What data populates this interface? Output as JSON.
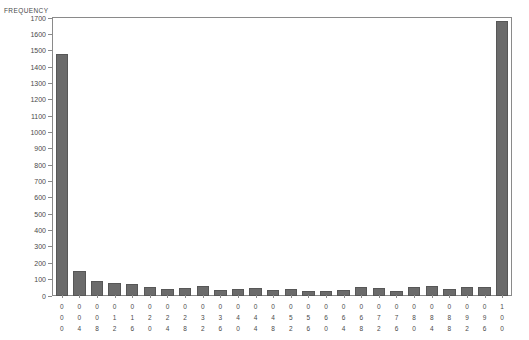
{
  "chart_data": {
    "type": "bar",
    "title": "",
    "subtitle": "",
    "xlabel": "",
    "ylabel": "FREQUENCY",
    "ylim": [
      0,
      1700
    ],
    "y_ticks": [
      0,
      100,
      200,
      300,
      400,
      500,
      600,
      700,
      800,
      900,
      1000,
      1100,
      1200,
      1300,
      1400,
      1500,
      1600,
      1700
    ],
    "grid": false,
    "legend": "none",
    "bar_color": "#6b6b6b",
    "bar_border_color": "#575757",
    "axis_color": "#8a8a8a",
    "text_color": "#4a4a4a",
    "background": "#ffffff",
    "categories": [
      "000",
      "004",
      "008",
      "012",
      "016",
      "020",
      "024",
      "028",
      "032",
      "036",
      "040",
      "044",
      "048",
      "052",
      "056",
      "060",
      "064",
      "068",
      "072",
      "076",
      "080",
      "084",
      "088",
      "092",
      "096",
      "100"
    ],
    "values": [
      1480,
      150,
      93,
      80,
      75,
      57,
      45,
      48,
      60,
      37,
      44,
      46,
      38,
      45,
      30,
      32,
      36,
      57,
      50,
      33,
      57,
      62,
      41,
      53,
      55,
      1680
    ]
  }
}
